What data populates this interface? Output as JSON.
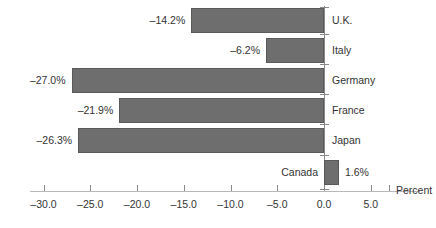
{
  "chart_data": {
    "type": "bar",
    "orientation": "horizontal",
    "title": "",
    "subtitle": "",
    "xlabel": "Percent",
    "ylabel": "",
    "xlim": [
      -32.5,
      7.5
    ],
    "grid": false,
    "legend": null,
    "categories": [
      "U.K.",
      "Italy",
      "Germany",
      "France",
      "Japan",
      "Canada"
    ],
    "values": [
      -14.2,
      -6.2,
      -27.0,
      -21.9,
      -26.3,
      1.6
    ],
    "value_labels": [
      "–14.2%",
      "–6.2%",
      "–27.0%",
      "–21.9%",
      "–26.3%",
      "1.6%"
    ],
    "xticks": [
      -30.0,
      -25.0,
      -20.0,
      -15.0,
      -10.0,
      -5.0,
      0.0,
      5.0
    ],
    "xtick_labels": [
      "–30.0",
      "–25.0",
      "–20.0",
      "–15.0",
      "–10.0",
      "–5.0",
      "0.0",
      "5.0"
    ],
    "bar_color": "#6e6e6e",
    "bar_edge_color": "#5a5a5a",
    "axis_color": "#8a8a8a",
    "text_color": "#333333",
    "background": "#ffffff"
  },
  "axis": {
    "percent_label": "Percent"
  }
}
